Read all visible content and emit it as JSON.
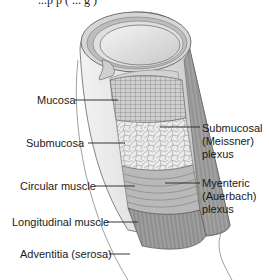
{
  "caption_fragment": "...p p  (   ...  g  )",
  "diagram": {
    "left_labels": [
      {
        "id": "mucosa",
        "text": "Mucosa"
      },
      {
        "id": "submucosa",
        "text": "Submucosa"
      },
      {
        "id": "circular-muscle",
        "text": "Circular muscle"
      },
      {
        "id": "longitudinal-muscle",
        "text": "Longitudinal muscle"
      },
      {
        "id": "adventitia",
        "text": "Adventitia (serosa)"
      }
    ],
    "right_labels": [
      {
        "id": "submucosal-plexus",
        "lines": [
          "Submucosal",
          "(Meissner)",
          "plexus"
        ]
      },
      {
        "id": "myenteric-plexus",
        "lines": [
          "Myenteric",
          "(Auerbach)",
          "plexus"
        ]
      }
    ]
  },
  "colors": {
    "background": "#ffffff",
    "tissue_light": "#e6e6e6",
    "tissue_mid": "#bdbdbd",
    "tissue_dark": "#8a8a8a",
    "muscle": "#9a9a9a",
    "outline": "#555555",
    "text": "#1a1a1a"
  }
}
